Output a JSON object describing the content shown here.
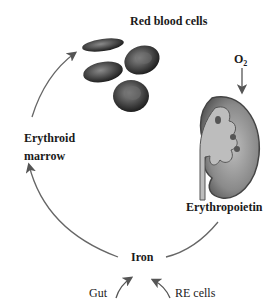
{
  "labels": {
    "red_blood_cells": "Red blood cells",
    "o2": "O",
    "o2_sub": "2",
    "erythroid": "Erythroid",
    "marrow": "marrow",
    "erythropoietin": "Erythropoietin",
    "iron": "Iron",
    "gut": "Gut",
    "re_cells": "RE cells"
  },
  "colors": {
    "arrow": "#555555",
    "text": "#1a1a1a",
    "cell_dark": "#2a2a2a",
    "kidney": "#777777"
  }
}
